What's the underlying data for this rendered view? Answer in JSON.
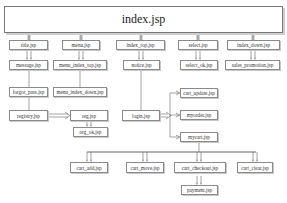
{
  "diagram": {
    "type": "jsp-page-navigation-structure",
    "root": {
      "id": "index",
      "label": "index.jsp"
    },
    "nodes": [
      {
        "id": "title",
        "label": "title.jsp"
      },
      {
        "id": "menu",
        "label": "menu.jsp"
      },
      {
        "id": "index_top",
        "label": "index_top.jsp"
      },
      {
        "id": "select",
        "label": "select.jsp"
      },
      {
        "id": "index_down",
        "label": "index_down.jsp"
      },
      {
        "id": "message",
        "label": "message.jsp"
      },
      {
        "id": "menu_index_top",
        "label": "menu_index_top.jsp"
      },
      {
        "id": "notice",
        "label": "notice.jsp"
      },
      {
        "id": "select_ok",
        "label": "select_ok.jsp"
      },
      {
        "id": "sales_promotion",
        "label": "sales_promotion.jsp"
      },
      {
        "id": "forgot_pass",
        "label": "forgot_pass.jsp"
      },
      {
        "id": "menu_index_down",
        "label": "menu_index_down.jsp"
      },
      {
        "id": "registry",
        "label": "registry.jsp"
      },
      {
        "id": "reg",
        "label": "reg.jsp"
      },
      {
        "id": "reg_ok",
        "label": "reg_ok.jsp"
      },
      {
        "id": "login",
        "label": "login.jsp"
      },
      {
        "id": "cart_update",
        "label": "cart_update.jsp"
      },
      {
        "id": "myorder",
        "label": "myorder.jsp"
      },
      {
        "id": "mycart",
        "label": "mycart.jsp"
      },
      {
        "id": "cart_add",
        "label": "cart_add.jsp"
      },
      {
        "id": "cart_move",
        "label": "cart_move.jsp"
      },
      {
        "id": "cart_checkout",
        "label": "cart_checkout.jsp"
      },
      {
        "id": "cart_clear",
        "label": "cart_clear.jsp"
      },
      {
        "id": "payment",
        "label": "payment.jsp"
      }
    ],
    "edges": [
      {
        "from": "index",
        "to": "title"
      },
      {
        "from": "index",
        "to": "menu"
      },
      {
        "from": "index",
        "to": "index_top"
      },
      {
        "from": "index",
        "to": "select"
      },
      {
        "from": "index",
        "to": "index_down"
      },
      {
        "from": "title",
        "to": "message"
      },
      {
        "from": "menu",
        "to": "menu_index_top"
      },
      {
        "from": "index_top",
        "to": "notice"
      },
      {
        "from": "select",
        "to": "select_ok"
      },
      {
        "from": "index_down",
        "to": "sales_promotion"
      },
      {
        "from": "message",
        "to": "forgot_pass"
      },
      {
        "from": "menu_index_top",
        "to": "menu_index_down"
      },
      {
        "from": "forgot_pass",
        "to": "registry"
      },
      {
        "from": "registry",
        "to": "reg"
      },
      {
        "from": "reg",
        "to": "reg_ok"
      },
      {
        "from": "notice",
        "to": "login"
      },
      {
        "from": "login",
        "to": "cart_update"
      },
      {
        "from": "login",
        "to": "myorder"
      },
      {
        "from": "login",
        "to": "mycart"
      },
      {
        "from": "mycart",
        "to": "cart_add"
      },
      {
        "from": "mycart",
        "to": "cart_move"
      },
      {
        "from": "mycart",
        "to": "cart_checkout"
      },
      {
        "from": "mycart",
        "to": "cart_clear"
      },
      {
        "from": "cart_checkout",
        "to": "payment"
      }
    ]
  }
}
